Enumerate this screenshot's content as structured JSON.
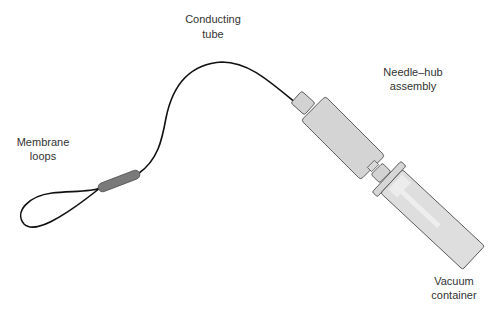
{
  "diagram": {
    "labels": {
      "membrane_loops": {
        "line1": "Membrane",
        "line2": "loops"
      },
      "conducting_tube": {
        "line1": "Conducting",
        "line2": "tube"
      },
      "needle_hub": {
        "line1": "Needle–hub",
        "line2": "assembly"
      },
      "vacuum_container": {
        "line1": "Vacuum",
        "line2": "container"
      }
    },
    "colors": {
      "tube": "#111111",
      "sleeve": "#7a7a7a",
      "hub_fill": "#d4d4d4",
      "container_fill": "#dcdcdc",
      "outline": "#555555",
      "text": "#333333"
    }
  }
}
